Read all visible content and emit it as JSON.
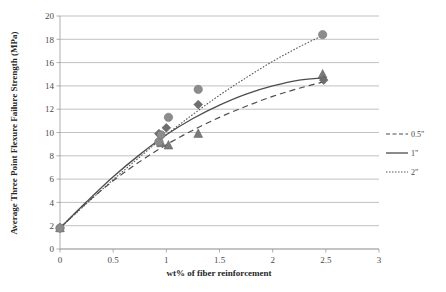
{
  "chart_data": {
    "type": "scatter",
    "title": "",
    "xlabel": "wt% of fiber reinforcement",
    "ylabel": "Average Three Point Flexure Failure Strength (MPa)",
    "xlim": [
      0,
      3
    ],
    "ylim": [
      0,
      20
    ],
    "xticks": [
      "0",
      "0.5",
      "1",
      "1.5",
      "2",
      "2.5",
      "3"
    ],
    "xtick_values": [
      0,
      0.5,
      1,
      1.5,
      2,
      2.5,
      3
    ],
    "yticks": [
      "0",
      "2",
      "4",
      "6",
      "8",
      "10",
      "12",
      "14",
      "16",
      "18",
      "20"
    ],
    "ytick_values": [
      0,
      2,
      4,
      6,
      8,
      10,
      12,
      14,
      16,
      18,
      20
    ],
    "grid": "horizontal",
    "legend_position": "right",
    "series": [
      {
        "name": "0.5\"",
        "marker": "triangle",
        "line_style": "dashed",
        "color": "#7a7a7a",
        "points": [
          {
            "x": 0.0,
            "y": 1.8
          },
          {
            "x": 0.95,
            "y": 9.1
          },
          {
            "x": 1.02,
            "y": 8.9
          },
          {
            "x": 1.3,
            "y": 9.9
          },
          {
            "x": 2.47,
            "y": 15.0
          }
        ],
        "trend": [
          [
            0.0,
            1.8
          ],
          [
            0.25,
            3.95
          ],
          [
            0.5,
            5.85
          ],
          [
            0.75,
            7.5
          ],
          [
            1.0,
            8.95
          ],
          [
            1.25,
            10.2
          ],
          [
            1.5,
            11.3
          ],
          [
            1.75,
            12.25
          ],
          [
            2.0,
            13.1
          ],
          [
            2.25,
            13.8
          ],
          [
            2.5,
            14.4
          ]
        ]
      },
      {
        "name": "1\"",
        "marker": "diamond",
        "line_style": "solid",
        "color": "#6e6e6e",
        "points": [
          {
            "x": 0.0,
            "y": 1.8
          },
          {
            "x": 0.93,
            "y": 9.9
          },
          {
            "x": 1.0,
            "y": 10.4
          },
          {
            "x": 1.3,
            "y": 12.4
          },
          {
            "x": 2.48,
            "y": 14.5
          }
        ],
        "trend": [
          [
            0.0,
            1.8
          ],
          [
            0.25,
            4.05
          ],
          [
            0.5,
            6.2
          ],
          [
            0.75,
            8.1
          ],
          [
            1.0,
            9.8
          ],
          [
            1.25,
            11.2
          ],
          [
            1.5,
            12.35
          ],
          [
            1.75,
            13.3
          ],
          [
            2.0,
            14.0
          ],
          [
            2.25,
            14.5
          ],
          [
            2.5,
            14.7
          ]
        ]
      },
      {
        "name": "2\"",
        "marker": "circle",
        "line_style": "dotted",
        "color": "#8c8c8c",
        "points": [
          {
            "x": 0.0,
            "y": 1.8
          },
          {
            "x": 0.93,
            "y": 9.2
          },
          {
            "x": 0.95,
            "y": 9.8
          },
          {
            "x": 1.02,
            "y": 11.3
          },
          {
            "x": 1.3,
            "y": 13.7
          },
          {
            "x": 2.47,
            "y": 18.4
          }
        ],
        "trend": [
          [
            0.0,
            1.8
          ],
          [
            0.25,
            3.9
          ],
          [
            0.5,
            5.95
          ],
          [
            0.75,
            7.9
          ],
          [
            1.0,
            9.8
          ],
          [
            1.25,
            11.55
          ],
          [
            1.5,
            13.2
          ],
          [
            1.75,
            14.7
          ],
          [
            2.0,
            16.1
          ],
          [
            2.25,
            17.35
          ],
          [
            2.5,
            18.45
          ]
        ]
      }
    ]
  },
  "legend": {
    "items": [
      {
        "label": "0.5\"",
        "style": "dashed"
      },
      {
        "label": "1\"",
        "style": "solid"
      },
      {
        "label": "2\"",
        "style": "dotted"
      }
    ]
  }
}
